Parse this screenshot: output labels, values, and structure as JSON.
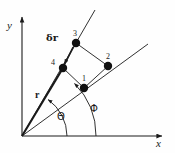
{
  "figure": {
    "type": "diagram",
    "background_color": "#fefefe",
    "ink_color": "#1a1a1a",
    "axes": {
      "x_label": "x",
      "y_label": "y",
      "origin": {
        "x": 22,
        "y": 136
      },
      "x_axis_end": {
        "x": 166,
        "y": 136
      },
      "y_axis_end": {
        "x": 22,
        "y": 12
      }
    },
    "points": [
      {
        "id": "1",
        "label": "1",
        "x": 84,
        "y": 88,
        "label_dx": -2,
        "label_dy": -13
      },
      {
        "id": "2",
        "label": "2",
        "x": 108,
        "y": 66,
        "label_dx": -2,
        "label_dy": -13
      },
      {
        "id": "3",
        "label": "3",
        "x": 76,
        "y": 43,
        "label_dx": -3,
        "label_dy": -13
      },
      {
        "id": "4",
        "label": "4",
        "x": 63,
        "y": 68,
        "label_dx": -12,
        "label_dy": -9
      }
    ],
    "rays": [
      {
        "name": "ray-phi",
        "from": {
          "x": 22,
          "y": 136
        },
        "to": {
          "x": 148,
          "y": 44
        }
      },
      {
        "name": "ray-theta",
        "from": {
          "x": 22,
          "y": 136
        },
        "to": {
          "x": 95,
          "y": 10
        }
      }
    ],
    "quadrilateral": {
      "name": "cell-boundary",
      "vertices": [
        {
          "x": 84,
          "y": 88
        },
        {
          "x": 108,
          "y": 66
        },
        {
          "x": 76,
          "y": 43
        },
        {
          "x": 63,
          "y": 68
        }
      ]
    },
    "arcs": [
      {
        "name": "arc-theta",
        "center": {
          "x": 22,
          "y": 136
        },
        "radius": 45,
        "label": "Θ",
        "label_x": 61,
        "label_y": 118
      },
      {
        "name": "arc-phi",
        "center": {
          "x": 22,
          "y": 136
        },
        "radius": 74,
        "label": "Φ",
        "label_x": 94,
        "label_y": 110
      }
    ],
    "vectors": [
      {
        "name": "r-vector",
        "label": "r",
        "label_x": 37,
        "label_y": 95,
        "from": {
          "x": 22,
          "y": 136
        },
        "to": {
          "x": 63,
          "y": 68
        }
      },
      {
        "name": "delta-r-vector",
        "label_delta": "δ",
        "label_r": "r",
        "label_x": 49,
        "label_y": 38,
        "arrow_from": {
          "x": 73,
          "y": 47
        },
        "arrow_to": {
          "x": 64,
          "y": 65
        }
      }
    ]
  }
}
